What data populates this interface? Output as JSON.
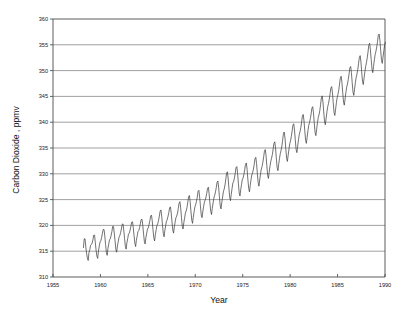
{
  "chart_data": {
    "type": "line",
    "title": "",
    "subtitle": "",
    "xlabel": "Year",
    "ylabel": "Carbon Dioxide , ppmv",
    "xlim": [
      1955,
      1990
    ],
    "ylim": [
      310,
      360
    ],
    "xticks": [
      1955,
      1960,
      1965,
      1970,
      1975,
      1980,
      1985,
      1990
    ],
    "xtick_labels": [
      "1955",
      "1960",
      "1965",
      "1970",
      "1975",
      "1980",
      "1985",
      "1990"
    ],
    "yticks": [
      310,
      315,
      320,
      325,
      330,
      335,
      340,
      345,
      350,
      355,
      360
    ],
    "ytick_labels": [
      "310",
      "315",
      "320",
      "325",
      "330",
      "335",
      "340",
      "345",
      "350",
      "355",
      "360"
    ],
    "grid": "horizontal",
    "legend": "none",
    "line_color": "#3a3a3a",
    "series": [
      {
        "name": "Atmospheric CO2 (Mauna Loa monthly mean)",
        "x": [
          1958.21,
          1958.29,
          1958.38,
          1958.46,
          1958.54,
          1958.63,
          1958.71,
          1958.79,
          1958.88,
          1958.96,
          1959.04,
          1959.13,
          1959.21,
          1959.29,
          1959.38,
          1959.46,
          1959.54,
          1959.63,
          1959.71,
          1959.79,
          1959.88,
          1959.96,
          1960.04,
          1960.13,
          1960.21,
          1960.29,
          1960.38,
          1960.46,
          1960.54,
          1960.63,
          1960.71,
          1960.79,
          1960.88,
          1960.96,
          1961.04,
          1961.13,
          1961.21,
          1961.29,
          1961.38,
          1961.46,
          1961.54,
          1961.63,
          1961.71,
          1961.79,
          1961.88,
          1961.96,
          1962.04,
          1962.13,
          1962.21,
          1962.29,
          1962.38,
          1962.46,
          1962.54,
          1962.63,
          1962.71,
          1962.79,
          1962.88,
          1962.96,
          1963.04,
          1963.13,
          1963.21,
          1963.29,
          1963.38,
          1963.46,
          1963.54,
          1963.63,
          1963.71,
          1963.79,
          1963.88,
          1963.96,
          1964.04,
          1964.13,
          1964.21,
          1964.29,
          1964.38,
          1964.46,
          1964.54,
          1964.63,
          1964.71,
          1964.79,
          1964.88,
          1964.96,
          1965.04,
          1965.13,
          1965.21,
          1965.29,
          1965.38,
          1965.46,
          1965.54,
          1965.63,
          1965.71,
          1965.79,
          1965.88,
          1965.96,
          1966.04,
          1966.13,
          1966.21,
          1966.29,
          1966.38,
          1966.46,
          1966.54,
          1966.63,
          1966.71,
          1966.79,
          1966.88,
          1966.96,
          1967.04,
          1967.13,
          1967.21,
          1967.29,
          1967.38,
          1967.46,
          1967.54,
          1967.63,
          1967.71,
          1967.79,
          1967.88,
          1967.96,
          1968.04,
          1968.13,
          1968.21,
          1968.29,
          1968.38,
          1968.46,
          1968.54,
          1968.63,
          1968.71,
          1968.79,
          1968.88,
          1968.96,
          1969.04,
          1969.13,
          1969.21,
          1969.29,
          1969.38,
          1969.46,
          1969.54,
          1969.63,
          1969.71,
          1969.79,
          1969.88,
          1969.96,
          1970.04,
          1970.13,
          1970.21,
          1970.29,
          1970.38,
          1970.46,
          1970.54,
          1970.63,
          1970.71,
          1970.79,
          1970.88,
          1970.96,
          1971.04,
          1971.13,
          1971.21,
          1971.29,
          1971.38,
          1971.46,
          1971.54,
          1971.63,
          1971.71,
          1971.79,
          1971.88,
          1971.96,
          1972.04,
          1972.13,
          1972.21,
          1972.29,
          1972.38,
          1972.46,
          1972.54,
          1972.63,
          1972.71,
          1972.79,
          1972.88,
          1972.96,
          1973.04,
          1973.13,
          1973.21,
          1973.29,
          1973.38,
          1973.46,
          1973.54,
          1973.63,
          1973.71,
          1973.79,
          1973.88,
          1973.96,
          1974.04,
          1974.13,
          1974.21,
          1974.29,
          1974.38,
          1974.46,
          1974.54,
          1974.63,
          1974.71,
          1974.79,
          1974.88,
          1974.96,
          1975.04,
          1975.13,
          1975.21,
          1975.29,
          1975.38,
          1975.46,
          1975.54,
          1975.63,
          1975.71,
          1975.79,
          1975.88,
          1975.96,
          1976.04,
          1976.13,
          1976.21,
          1976.29,
          1976.38,
          1976.46,
          1976.54,
          1976.63,
          1976.71,
          1976.79,
          1976.88,
          1976.96,
          1977.04,
          1977.13,
          1977.21,
          1977.29,
          1977.38,
          1977.46,
          1977.54,
          1977.63,
          1977.71,
          1977.79,
          1977.88,
          1977.96,
          1978.04,
          1978.13,
          1978.21,
          1978.29,
          1978.38,
          1978.46,
          1978.54,
          1978.63,
          1978.71,
          1978.79,
          1978.88,
          1978.96,
          1979.04,
          1979.13,
          1979.21,
          1979.29,
          1979.38,
          1979.46,
          1979.54,
          1979.63,
          1979.71,
          1979.79,
          1979.88,
          1979.96,
          1980.04,
          1980.13,
          1980.21,
          1980.29,
          1980.38,
          1980.46,
          1980.54,
          1980.63,
          1980.71,
          1980.79,
          1980.88,
          1980.96,
          1981.04,
          1981.13,
          1981.21,
          1981.29,
          1981.38,
          1981.46,
          1981.54,
          1981.63,
          1981.71,
          1981.79,
          1981.88,
          1981.96,
          1982.04,
          1982.13,
          1982.21,
          1982.29,
          1982.38,
          1982.46,
          1982.54,
          1982.63,
          1982.71,
          1982.79,
          1982.88,
          1982.96,
          1983.04,
          1983.13,
          1983.21,
          1983.29,
          1983.38,
          1983.46,
          1983.54,
          1983.63,
          1983.71,
          1983.79,
          1983.88,
          1983.96,
          1984.04,
          1984.13,
          1984.21,
          1984.29,
          1984.38,
          1984.46,
          1984.54,
          1984.63,
          1984.71,
          1984.79,
          1984.88,
          1984.96,
          1985.04,
          1985.13,
          1985.21,
          1985.29,
          1985.38,
          1985.46,
          1985.54,
          1985.63,
          1985.71,
          1985.79,
          1985.88,
          1985.96,
          1986.04,
          1986.13,
          1986.21,
          1986.29,
          1986.38,
          1986.46,
          1986.54,
          1986.63,
          1986.71,
          1986.79,
          1986.88,
          1986.96,
          1987.04,
          1987.13,
          1987.21,
          1987.29,
          1987.38,
          1987.46,
          1987.54,
          1987.63,
          1987.71,
          1987.79,
          1987.88,
          1987.96,
          1988.04,
          1988.13,
          1988.21,
          1988.29,
          1988.38,
          1988.46,
          1988.54,
          1988.63,
          1988.71,
          1988.79,
          1988.88,
          1988.96,
          1989.04,
          1989.13,
          1989.21,
          1989.29,
          1989.38,
          1989.46,
          1989.54,
          1989.63,
          1989.71,
          1989.79,
          1989.88,
          1989.96,
          1990.04
        ],
        "values": [
          315.7,
          317.4,
          317.4,
          315.8,
          314.6,
          313.6,
          313.2,
          314.7,
          315.3,
          316.1,
          316.3,
          316.6,
          317.2,
          318.1,
          318.1,
          316.7,
          315.2,
          314.0,
          313.6,
          315.0,
          316.0,
          316.8,
          317.0,
          317.7,
          318.5,
          319.2,
          319.2,
          318.0,
          316.3,
          314.7,
          314.2,
          315.5,
          316.4,
          317.2,
          317.4,
          318.1,
          318.8,
          319.8,
          319.8,
          318.5,
          317.0,
          315.3,
          314.8,
          316.0,
          316.9,
          317.7,
          318.0,
          318.6,
          319.3,
          320.2,
          320.3,
          319.1,
          317.5,
          315.9,
          315.4,
          316.6,
          317.5,
          318.3,
          318.5,
          319.1,
          319.8,
          320.6,
          320.7,
          319.6,
          318.1,
          316.5,
          315.9,
          317.1,
          318.0,
          318.8,
          319.0,
          319.6,
          320.3,
          321.1,
          321.2,
          320.1,
          318.5,
          316.9,
          316.4,
          317.6,
          318.5,
          319.3,
          319.5,
          320.2,
          320.9,
          321.8,
          322.0,
          320.9,
          319.2,
          317.6,
          317.0,
          318.2,
          319.2,
          320.0,
          320.3,
          321.0,
          321.8,
          322.7,
          323.0,
          321.8,
          320.1,
          318.4,
          317.8,
          319.0,
          320.0,
          320.8,
          321.1,
          321.8,
          322.5,
          323.4,
          323.6,
          322.4,
          320.8,
          319.1,
          318.5,
          319.7,
          320.7,
          321.5,
          321.8,
          322.4,
          323.3,
          324.3,
          324.6,
          323.4,
          321.6,
          319.8,
          319.3,
          320.5,
          321.5,
          322.4,
          322.8,
          323.5,
          324.5,
          325.5,
          325.8,
          324.6,
          322.8,
          321.0,
          320.4,
          321.6,
          322.7,
          323.6,
          324.0,
          324.7,
          325.5,
          326.6,
          326.8,
          325.5,
          323.8,
          322.0,
          321.5,
          322.6,
          323.7,
          324.5,
          324.9,
          325.5,
          326.2,
          327.2,
          327.4,
          326.1,
          324.4,
          322.7,
          322.1,
          323.3,
          324.4,
          325.3,
          325.8,
          326.5,
          327.3,
          328.3,
          328.6,
          327.4,
          325.6,
          323.8,
          323.2,
          324.4,
          325.5,
          326.5,
          327.0,
          327.8,
          328.8,
          330.0,
          330.4,
          329.2,
          327.3,
          325.4,
          324.8,
          326.0,
          327.2,
          328.2,
          328.5,
          329.2,
          330.1,
          331.2,
          331.4,
          330.1,
          328.2,
          326.3,
          325.7,
          326.9,
          328.0,
          328.9,
          329.2,
          329.9,
          330.8,
          331.8,
          332.1,
          330.9,
          329.0,
          327.2,
          326.5,
          327.7,
          328.9,
          329.8,
          330.2,
          330.9,
          331.8,
          332.9,
          333.2,
          332.0,
          330.1,
          328.3,
          327.6,
          328.8,
          330.0,
          330.9,
          331.4,
          332.3,
          333.3,
          334.4,
          334.7,
          333.5,
          331.6,
          329.7,
          329.1,
          330.3,
          331.5,
          332.4,
          333.0,
          333.8,
          334.8,
          335.9,
          336.2,
          335.0,
          333.1,
          331.2,
          330.6,
          331.8,
          333.0,
          333.9,
          334.5,
          335.4,
          336.5,
          337.8,
          338.1,
          336.9,
          334.9,
          333.0,
          332.4,
          333.6,
          334.8,
          335.8,
          336.4,
          337.3,
          338.3,
          339.4,
          339.7,
          338.5,
          336.6,
          334.7,
          334.1,
          335.3,
          336.6,
          337.6,
          338.2,
          339.0,
          340.0,
          341.2,
          341.5,
          340.3,
          338.4,
          336.5,
          335.9,
          337.1,
          338.4,
          339.4,
          339.9,
          340.7,
          341.6,
          342.7,
          343.0,
          341.8,
          339.9,
          338.0,
          337.4,
          338.6,
          339.9,
          340.9,
          341.4,
          342.3,
          343.4,
          344.7,
          345.1,
          343.9,
          342.0,
          340.1,
          339.5,
          340.7,
          342.0,
          343.0,
          343.6,
          344.5,
          345.5,
          346.6,
          346.9,
          345.7,
          343.8,
          341.9,
          341.3,
          342.5,
          343.8,
          344.8,
          345.4,
          346.3,
          347.4,
          348.6,
          348.9,
          347.7,
          345.8,
          343.9,
          343.3,
          344.5,
          345.8,
          346.8,
          347.4,
          348.3,
          349.3,
          350.5,
          350.8,
          349.6,
          347.7,
          345.8,
          345.2,
          346.4,
          347.7,
          348.7,
          349.3,
          350.2,
          351.3,
          352.5,
          352.9,
          351.7,
          349.8,
          347.9,
          347.3,
          348.5,
          349.8,
          350.8,
          351.5,
          352.5,
          353.6,
          354.9,
          355.3,
          354.1,
          352.2,
          350.3,
          349.6,
          350.8,
          352.1,
          353.1,
          353.7,
          354.6,
          355.6,
          356.8,
          357.1,
          355.9,
          354.0,
          352.1,
          351.4,
          352.6,
          353.9,
          354.9,
          355.5
        ]
      }
    ]
  },
  "axes": {
    "ylabel": "Carbon Dioxide , ppmv",
    "xlabel": "Year"
  }
}
